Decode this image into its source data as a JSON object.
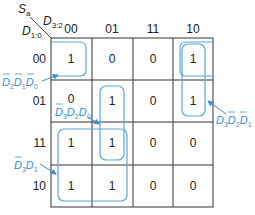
{
  "kmap": {
    "output": "S",
    "output_sub": "a",
    "col_var": "D",
    "col_var_sub": "3:2",
    "row_var": "D",
    "row_var_sub": "1:0",
    "col_headers": [
      "00",
      "01",
      "11",
      "10"
    ],
    "row_headers": [
      "00",
      "01",
      "11",
      "10"
    ],
    "cells": [
      [
        "1",
        "0",
        "0",
        "1"
      ],
      [
        "0",
        "1",
        "0",
        "1"
      ],
      [
        "1",
        "1",
        "0",
        "0"
      ],
      [
        "1",
        "1",
        "0",
        "0"
      ]
    ]
  },
  "implicants": [
    {
      "id": "nd2-nd1-nd0",
      "label": "D̄2D̄1D̄0",
      "terms": [
        {
          "v": "D",
          "s": "2",
          "bar": true
        },
        {
          "v": "D",
          "s": "1",
          "bar": true
        },
        {
          "v": "D",
          "s": "0",
          "bar": true
        }
      ]
    },
    {
      "id": "nd3-d2-d0",
      "label": "D̄3D2D0",
      "terms": [
        {
          "v": "D",
          "s": "3",
          "bar": true
        },
        {
          "v": "D",
          "s": "2",
          "bar": false
        },
        {
          "v": "D",
          "s": "0",
          "bar": false
        }
      ]
    },
    {
      "id": "nd3-d1",
      "label": "D̄3D1",
      "terms": [
        {
          "v": "D",
          "s": "3",
          "bar": true
        },
        {
          "v": "D",
          "s": "1",
          "bar": false
        }
      ]
    },
    {
      "id": "d3-nd2-nd1",
      "label": "D3D̄2D̄1",
      "terms": [
        {
          "v": "D",
          "s": "3",
          "bar": false
        },
        {
          "v": "D",
          "s": "2",
          "bar": true
        },
        {
          "v": "D",
          "s": "1",
          "bar": true
        }
      ]
    }
  ],
  "colors": {
    "grid": "#333333",
    "loop": "#5aa6dd",
    "label": "#3a8fd0"
  }
}
